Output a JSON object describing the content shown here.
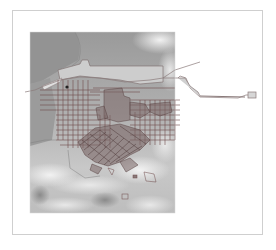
{
  "map": {
    "type": "hillshade raster with urban street/block overlay",
    "frame": {
      "x": 12,
      "y": 10,
      "width": 251,
      "height": 225,
      "border_color": "#cfcfcf"
    },
    "raster_extent": {
      "x": 30,
      "y": 32,
      "width": 145,
      "height": 181
    },
    "colors": {
      "background": "#ffffff",
      "water": "#8f8f8f",
      "lowland": "#b4b4b4",
      "terrain_light": "#e6e6e6",
      "terrain_mid": "#a8a8a8",
      "street_lines": "#6e4a4a",
      "dense_blocks": "#5a4545",
      "boundary_lines": "#7a6a6a",
      "waterfront_fill": "#cfcfcf"
    },
    "layers": [
      {
        "name": "elevation-hillshade",
        "kind": "raster"
      },
      {
        "name": "shoreline",
        "kind": "polygon"
      },
      {
        "name": "street-grid",
        "kind": "lines"
      },
      {
        "name": "urban-blocks",
        "kind": "polygon"
      },
      {
        "name": "rail-corridor",
        "kind": "line",
        "extends_east_outside_raster": true
      }
    ]
  }
}
